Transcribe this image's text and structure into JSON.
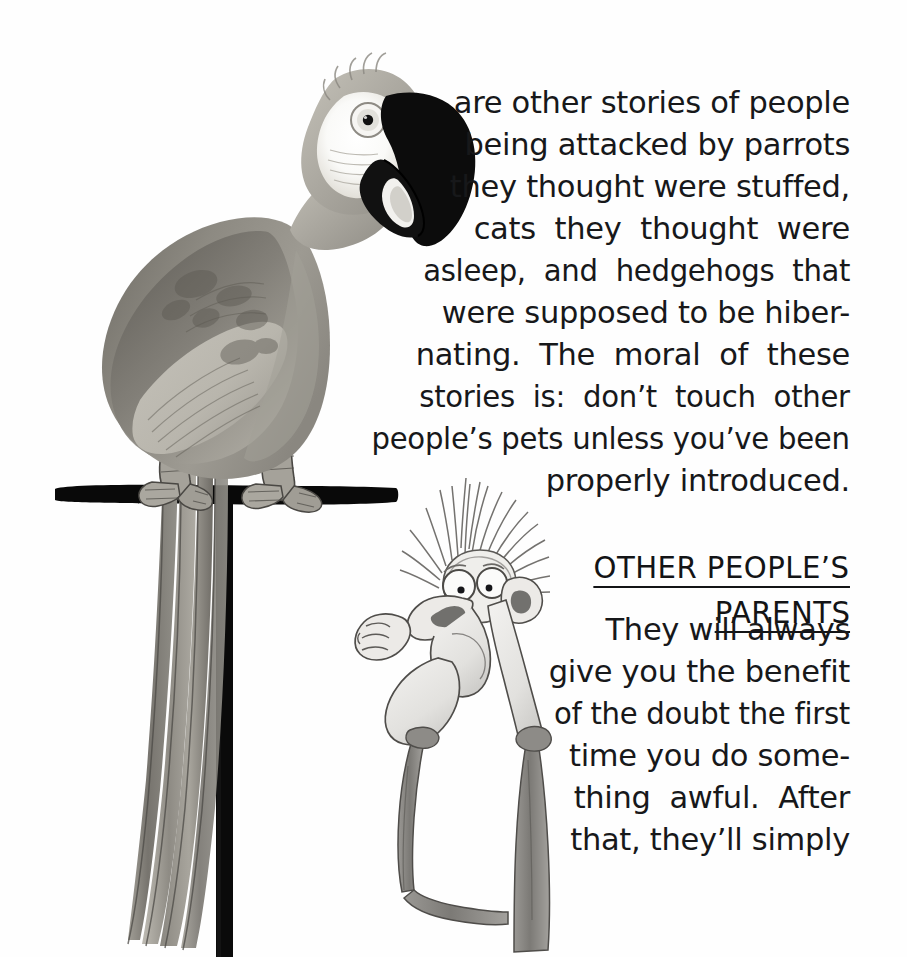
{
  "page": {
    "background_color": "#fefefe",
    "text_color": "#17181a",
    "width": 907,
    "height": 957
  },
  "body_text": {
    "full_paragraph": "are other stories of people being attacked by parrots they thought were stuffed, cats they thought were asleep, and hedgehogs that were supposed to be hibernating. The moral of these stories is: don't touch other people's pets unless you've been properly introduced.",
    "lines": [
      "are other stories of people",
      "being attacked by parrots",
      "they thought were stuffed,",
      "cats  they  thought  were",
      "asleep,  and  hedgehogs  that",
      "were supposed to be hiber-",
      "nating.  The  moral  of  these",
      "stories  is:  don’t  touch  other",
      "people’s pets unless you’ve been",
      "properly introduced."
    ]
  },
  "heading": {
    "line1": "OTHER PEOPLE’S",
    "line2": "PARENTS",
    "style": "underlined-uppercase"
  },
  "body_text_2": {
    "full_paragraph": "They will always give you the benefit of the doubt the first time you do something awful. After that, they’ll simply",
    "lines": [
      "They will always",
      "give you the benefit",
      "of the doubt the first",
      "time you do some-",
      "thing  awful.  After",
      "that, they’ll simply"
    ]
  },
  "illustration": {
    "parrot": {
      "name": "macaw-parrot",
      "description": "Large macaw perched on a black T-shaped stand, beak open, long tail feathers hanging down",
      "colors": {
        "beak": "#0d0d0d",
        "face_patch": "#fbfbfa",
        "head": "#b9b6ae",
        "body": "#8b8880",
        "wing_dark": "#6e6b64",
        "wing_light": "#c7c4bb",
        "tail": "#9b9890",
        "talons": "#a5a29a",
        "perch": "#0a0a0a",
        "eye_ring": "#d8d5cd",
        "pupil": "#131313"
      }
    },
    "man": {
      "name": "startled-cartoon-man",
      "description": "Cartoon man with wild spiky hair, bulging eyes, large nose, clutching hand raised, thin legs",
      "colors": {
        "ink": "#3d3d40",
        "skin": "#e9e8e5",
        "hair": "#8e8c89",
        "trousers": "#8a8884",
        "shoe": "#6d6b67"
      }
    }
  }
}
